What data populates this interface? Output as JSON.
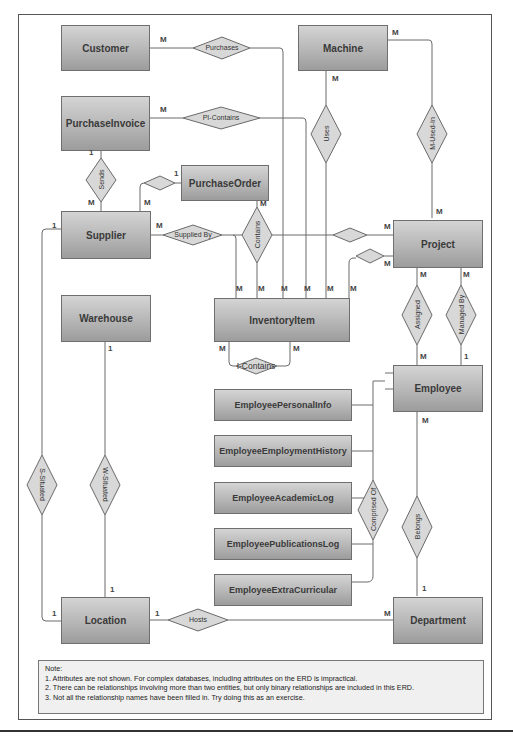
{
  "entities": {
    "customer": "Customer",
    "machine": "Machine",
    "purchase_invoice": "PurchaseInvoice",
    "purchase_order": "PurchaseOrder",
    "supplier": "Supplier",
    "project": "Project",
    "warehouse": "Warehouse",
    "inventory_item": "InventoryItem",
    "employee": "Employee",
    "employee_personal_info": "EmployeePersonalInfo",
    "employee_employment_history": "EmployeeEmploymentHistory",
    "employee_academic_log": "EmployeeAcademicLog",
    "employee_publications_log": "EmployeePublicationsLog",
    "employee_extra_curricular": "EmployeeExtraCurricular",
    "location": "Location",
    "department": "Department"
  },
  "relationships": {
    "purchases": "Purchases",
    "pi_contains": "PI-Contains",
    "uses": "Uses",
    "m_used_in": "M-Used-In",
    "sends": "Sends",
    "supplied_by": "Supplied By",
    "contains": "Contains",
    "i_contains": "I-Contains",
    "assigned": "Assigned",
    "managed_by": "Managed By",
    "comprised_of": "Comprised Of",
    "belongs": "Belongs",
    "s_situated": "S-Situated",
    "w_situated": "W-Situated",
    "hosts": "Hosts"
  },
  "cardinalities": {
    "M": "M",
    "one": "1"
  },
  "note": {
    "title": "Note:",
    "lines": [
      "1. Attributes are not shown. For complex databases, including attributes on the ERD is impractical.",
      "2. There can be relationships involving more than two entities, but only binary relationships are included in this ERD.",
      "3. Not all the relationship names have been filled in. Try doing this as an exercise."
    ]
  }
}
